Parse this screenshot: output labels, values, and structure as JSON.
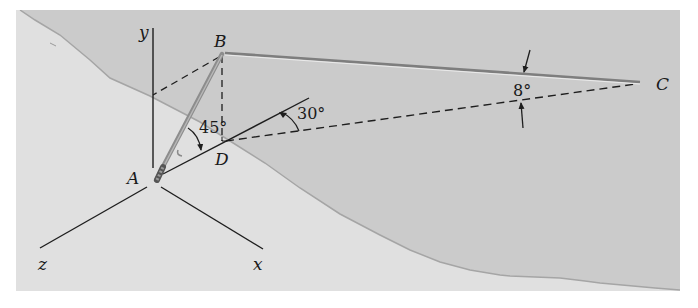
{
  "figure": {
    "colors": {
      "background": "#ffffff",
      "hill_light": "#e2e2e2",
      "hill_dark": "#c9c9c9",
      "ground_line": "#a8a8a8",
      "line": "#1e1e1e",
      "cable": "#7a7a7a",
      "pole": "#8a8a8a"
    },
    "axes": {
      "x_label": "x",
      "y_label": "y",
      "z_label": "z"
    },
    "points": {
      "A": "A",
      "B": "B",
      "C": "C",
      "D": "D"
    },
    "angles": {
      "pole_to_AD": "45°",
      "AD_to_DC": "30°",
      "cable_to_DC": "8°"
    }
  }
}
